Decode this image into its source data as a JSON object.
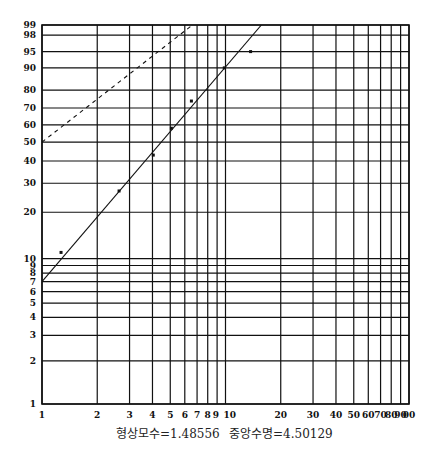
{
  "chart_data": {
    "type": "scatter",
    "title": "",
    "plot_kind": "Weibull probability plot",
    "xlabel": "",
    "ylabel": "",
    "x_scale": "log",
    "y_scale": "weibull",
    "xlim": [
      1,
      100
    ],
    "ylim_percent": [
      1,
      99
    ],
    "grid": true,
    "x_ticks": [
      1,
      2,
      3,
      4,
      5,
      6,
      7,
      8,
      9,
      10,
      20,
      30,
      40,
      50,
      60,
      70,
      80,
      90,
      100
    ],
    "x_tick_labels": [
      "1",
      "2",
      "3",
      "4",
      "5",
      "6",
      "7",
      "8",
      "9",
      "10",
      "20",
      "30",
      "40",
      "50",
      "60",
      "70",
      "80",
      "90",
      "00"
    ],
    "y_ticks_percent": [
      1,
      2,
      3,
      4,
      5,
      6,
      7,
      8,
      9,
      10,
      20,
      30,
      40,
      50,
      60,
      70,
      80,
      90,
      95,
      98,
      99
    ],
    "y_tick_labels": [
      "1",
      "2",
      "3",
      "4",
      "5",
      "6",
      "7",
      "8",
      "9",
      "10",
      "20",
      "30",
      "40",
      "50",
      "60",
      "70",
      "80",
      "90",
      "95",
      "98",
      "99"
    ],
    "series": [
      {
        "name": "observed",
        "style": "points",
        "x": [
          1.27,
          2.63,
          4.04,
          5.07,
          6.52,
          9.85,
          13.7
        ],
        "y_percent": [
          11,
          27,
          43,
          58,
          74,
          90,
          95
        ]
      },
      {
        "name": "fitted line",
        "style": "solid",
        "x": [
          1.0,
          15.7
        ],
        "y_percent": [
          7,
          99
        ]
      },
      {
        "name": "reference line",
        "style": "dashed",
        "x": [
          1.0,
          6.6
        ],
        "y_percent": [
          50,
          99
        ]
      }
    ],
    "parameters": {
      "shape": 1.48556,
      "median_life": 4.50129
    }
  },
  "caption": {
    "shape_label": "형상모수=1.48556",
    "median_label": "중앙수명=4.50129"
  }
}
